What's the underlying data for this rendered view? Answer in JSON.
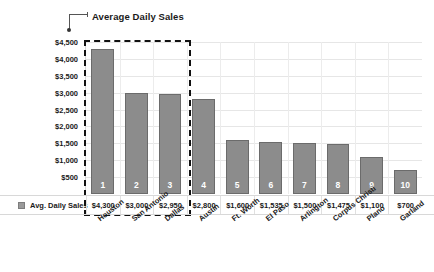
{
  "chart_data": {
    "type": "bar",
    "title": "Average Daily Sales",
    "xlabel": "",
    "ylabel": "",
    "ylim": [
      0,
      4500
    ],
    "grid": true,
    "legend_position": "bottom-left",
    "series_name": "Avg. Daily Sales",
    "categories": [
      "Houston",
      "San Antonio",
      "Dallas",
      "Austin",
      "Ft. Worth",
      "El Paso",
      "Arlington",
      "Corpus Christi",
      "Plano",
      "Garland"
    ],
    "values": [
      4300,
      3000,
      2950,
      2800,
      1600,
      1535,
      1500,
      1475,
      1100,
      700
    ],
    "value_labels": [
      "$4,300",
      "$3,000",
      "$2,950",
      "$2,800",
      "$1,600",
      "$1,535",
      "$1,500",
      "$1,475",
      "$1,100",
      "$700"
    ],
    "rank_labels": [
      "1",
      "2",
      "3",
      "4",
      "5",
      "6",
      "7",
      "8",
      "9",
      "10"
    ],
    "ytick_labels": [
      "$4,500",
      "$4,000",
      "$3,500",
      "$3,000",
      "$2,500",
      "$2,000",
      "$1,500",
      "$1,000",
      "$500"
    ],
    "ytick_values": [
      4500,
      4000,
      3500,
      3000,
      2500,
      2000,
      1500,
      1000,
      500
    ],
    "annotation": {
      "name": "selection-rectangle",
      "covers_categories": [
        "Houston",
        "San Antonio",
        "Dallas"
      ],
      "style": "dashed"
    },
    "colors": {
      "bar_fill": "#8c8c8c",
      "bar_stroke": "#6b6b6b",
      "grid": "#e6e6e6",
      "text": "#1a1a1a",
      "selection": "#111111",
      "background": "#ffffff"
    }
  },
  "legend": {
    "label": "Avg. Daily Sales"
  }
}
